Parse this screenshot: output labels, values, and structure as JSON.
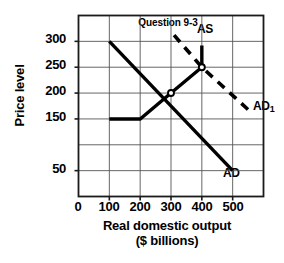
{
  "chart_data": {
    "type": "line",
    "title": "Question 9-3",
    "xlabel_line1": "Real domestic output",
    "xlabel_line2": "($ billions)",
    "ylabel": "Price level",
    "xlim": [
      0,
      600
    ],
    "ylim": [
      0,
      350
    ],
    "grid": true,
    "legend_position": "inline-curve-labels",
    "xticks": [
      "0",
      "100",
      "200",
      "300",
      "400",
      "500"
    ],
    "xtick_values": [
      0,
      100,
      200,
      300,
      400,
      500
    ],
    "yticks": [
      "300",
      "250",
      "200",
      "150",
      "50"
    ],
    "ytick_values": [
      300,
      250,
      200,
      150,
      50
    ],
    "gridlines_x": [
      100,
      200,
      300,
      400,
      500
    ],
    "gridlines_y": [
      50,
      100,
      150,
      200,
      250,
      300
    ],
    "series": [
      {
        "name": "AD",
        "label": "AD",
        "style": "solid",
        "color": "#000000",
        "points": [
          [
            100,
            300
          ],
          [
            500,
            50
          ]
        ]
      },
      {
        "name": "AS",
        "label": "AS",
        "style": "solid",
        "color": "#000000",
        "points": [
          [
            100,
            150
          ],
          [
            200,
            150
          ],
          [
            300,
            200
          ],
          [
            400,
            250
          ],
          [
            400,
            292
          ]
        ]
      },
      {
        "name": "AD1",
        "label": "AD",
        "label_subscript": "1",
        "style": "dashed",
        "color": "#000000",
        "points": [
          [
            310,
            312
          ],
          [
            400,
            250
          ],
          [
            565,
            160
          ]
        ]
      }
    ],
    "markers": [
      {
        "name": "equilibrium-initial",
        "x": 300,
        "y": 200,
        "style": "open-circle"
      },
      {
        "name": "equilibrium-new",
        "x": 400,
        "y": 250,
        "style": "open-circle"
      }
    ],
    "annotations": [
      {
        "name": "as-label",
        "text": "AS",
        "x": 400,
        "y": 310
      },
      {
        "name": "ad-label",
        "text": "AD",
        "x": 505,
        "y": 35
      },
      {
        "name": "ad1-label",
        "text": "AD",
        "subscript": "1",
        "x": 545,
        "y": 190
      }
    ]
  }
}
